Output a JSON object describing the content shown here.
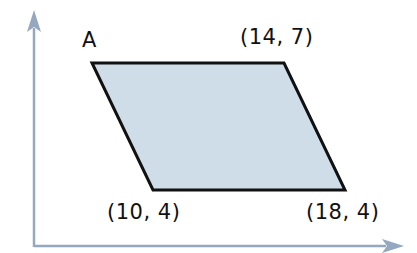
{
  "diagram": {
    "type": "coordinate-geometry",
    "shape": "parallelogram",
    "colors": {
      "fill": "#CFDDE8",
      "stroke": "#111111",
      "axes": "#94A8C0",
      "text": "#111111"
    },
    "axes": {
      "x_axis": {
        "arrow": true
      },
      "y_axis": {
        "arrow": true
      }
    },
    "vertices": [
      {
        "id": "A",
        "name_label": "A",
        "coord_label": ""
      },
      {
        "id": "top-right",
        "name_label": "",
        "coord_label": "(14, 7)"
      },
      {
        "id": "bottom-right",
        "name_label": "",
        "coord_label": "(18, 4)"
      },
      {
        "id": "bottom-left",
        "name_label": "",
        "coord_label": "(10, 4)"
      }
    ],
    "labels": {
      "vertex_a": "A",
      "top_right": "(14, 7)",
      "bottom_left": "(10, 4)",
      "bottom_right": "(18, 4)"
    }
  }
}
